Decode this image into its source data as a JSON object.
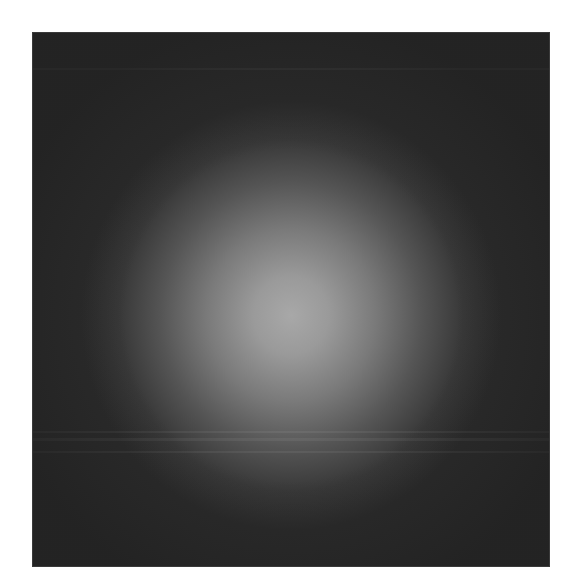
{
  "image": {
    "description": "Dark square with a soft radial gray glow in the center",
    "background_color": "#ffffff",
    "square_color": "#2a2a2a",
    "glow_color": "#a8a8a8"
  }
}
